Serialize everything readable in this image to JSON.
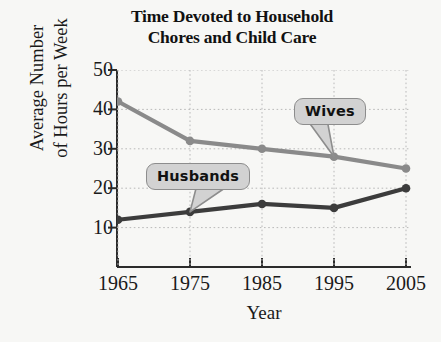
{
  "chart_data": {
    "type": "line",
    "title": "Time Devoted to Household Chores and Child Care",
    "title_lines": [
      "Time Devoted to Household",
      "Chores and Child Care"
    ],
    "xlabel": "Year",
    "ylabel": "Average Number of Hours per Week",
    "ylabel_lines": [
      "Average Number",
      "of Hours per Week"
    ],
    "categories": [
      1965,
      1975,
      1985,
      1995,
      2005
    ],
    "xtick_labels": [
      "1965",
      "1975",
      "1985",
      "1995",
      "2005"
    ],
    "ytick_labels": [
      "10",
      "20",
      "30",
      "40",
      "50"
    ],
    "yticks": [
      10,
      20,
      30,
      40,
      50
    ],
    "ylim": [
      0,
      50
    ],
    "xlim": [
      1965,
      2005
    ],
    "grid": true,
    "legend_position": "inline-callouts",
    "series": [
      {
        "name": "Wives",
        "values": [
          42,
          32,
          30,
          28,
          25
        ],
        "color": "#8a8a8a",
        "annotation_anchor_index": 3
      },
      {
        "name": "Husbands",
        "values": [
          12,
          14,
          16,
          15,
          20
        ],
        "color": "#3c3c3c",
        "annotation_anchor_index": 1
      }
    ],
    "annotations": [
      {
        "label": "Wives",
        "points_to": {
          "year": 1995,
          "value": 28
        }
      },
      {
        "label": "Husbands",
        "points_to": {
          "year": 1975,
          "value": 14
        }
      }
    ]
  },
  "colors": {
    "background": "#f7f7f5",
    "axis": "#2b2b2b",
    "grid": "#b9b9b9",
    "wives_line": "#8a8a8a",
    "husbands_line": "#3c3c3c",
    "callout_fill": "#d2d2d2",
    "callout_border": "#8d8d8d",
    "text": "#1a1a1a"
  }
}
